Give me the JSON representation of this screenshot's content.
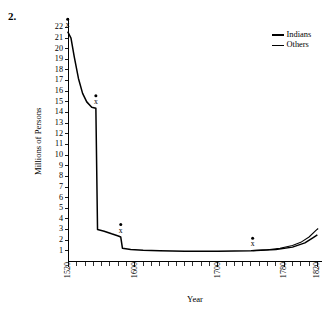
{
  "figure": {
    "number_label": "2."
  },
  "chart_data": {
    "type": "line",
    "title": "",
    "xlabel": "Year",
    "ylabel": "Millions of Persons",
    "xlim": [
      1520,
      1825
    ],
    "ylim": [
      0,
      22.6
    ],
    "yticks": [
      1,
      2,
      3,
      4,
      5,
      6,
      7,
      8,
      9,
      10,
      11,
      12,
      13,
      14,
      15,
      16,
      17,
      18,
      19,
      20,
      21,
      22
    ],
    "ytick_labels": [
      "1",
      "2",
      "3",
      "4",
      "5",
      "6",
      "7",
      "8",
      "9",
      "10",
      "11",
      "12",
      "13",
      "14",
      "15",
      "16",
      "17",
      "18",
      "19",
      "20",
      "21",
      "22"
    ],
    "xticks_labeled": [
      1520,
      1600,
      1700,
      1780,
      1820
    ],
    "xtick_labels": [
      "1520",
      "1600",
      "1700",
      "1780",
      "1820"
    ],
    "xtick_minor_step": 10,
    "grid": false,
    "legend_position": "top-right",
    "series": [
      {
        "name": "Indians",
        "style": "thick",
        "points": [
          [
            1519,
            21.6
          ],
          [
            1523,
            21.0
          ],
          [
            1527,
            19.2
          ],
          [
            1532,
            17.2
          ],
          [
            1537,
            15.8
          ],
          [
            1542,
            15.0
          ],
          [
            1548,
            14.5
          ],
          [
            1553,
            14.4
          ],
          [
            1555,
            3.0
          ],
          [
            1563,
            2.85
          ],
          [
            1572,
            2.6
          ],
          [
            1580,
            2.4
          ],
          [
            1583,
            2.3
          ],
          [
            1585,
            1.25
          ],
          [
            1595,
            1.12
          ],
          [
            1610,
            1.05
          ],
          [
            1630,
            1.0
          ],
          [
            1660,
            0.97
          ],
          [
            1700,
            0.97
          ],
          [
            1740,
            1.02
          ],
          [
            1770,
            1.12
          ],
          [
            1790,
            1.35
          ],
          [
            1805,
            1.75
          ],
          [
            1815,
            2.25
          ],
          [
            1820,
            2.5
          ]
        ]
      },
      {
        "name": "Others",
        "style": "thin",
        "points": [
          [
            1742,
            1.02
          ],
          [
            1760,
            1.1
          ],
          [
            1775,
            1.25
          ],
          [
            1790,
            1.5
          ],
          [
            1800,
            1.8
          ],
          [
            1810,
            2.3
          ],
          [
            1818,
            2.9
          ],
          [
            1821,
            3.1
          ]
        ]
      }
    ],
    "annotations": [
      {
        "label": "x",
        "x": 1519,
        "y": 21.6,
        "marker": "dot-x"
      },
      {
        "label": "x",
        "x": 1553,
        "y": 14.4,
        "marker": "dot-x"
      },
      {
        "label": "x",
        "x": 1583,
        "y": 2.3,
        "marker": "dot-x"
      },
      {
        "label": "x",
        "x": 1742,
        "y": 1.02,
        "marker": "dot-x"
      }
    ]
  },
  "legend": {
    "entries": [
      {
        "label": "Indians",
        "style": "thick"
      },
      {
        "label": "Others",
        "style": "thin"
      }
    ]
  },
  "colors": {
    "ink": "#000000",
    "background": "#ffffff"
  }
}
